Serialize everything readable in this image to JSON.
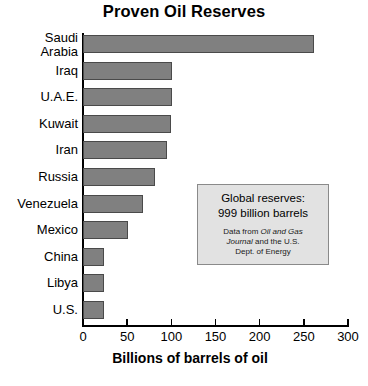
{
  "chart_data": {
    "type": "bar",
    "orientation": "horizontal",
    "title": "Proven Oil Reserves",
    "xlabel": "Billions of barrels of oil",
    "ylabel": "",
    "xlim": [
      0,
      300
    ],
    "xticks": [
      0,
      50,
      100,
      150,
      200,
      250,
      300
    ],
    "grid": false,
    "legend": null,
    "bar_color": "#808080",
    "bar_edge_color": "#4a4a4a",
    "categories": [
      "Saudi Arabia",
      "Iraq",
      "U.A.E.",
      "Kuwait",
      "Iran",
      "Russia",
      "Venezuela",
      "Mexico",
      "China",
      "Libya",
      "U.S."
    ],
    "values": [
      262,
      101,
      101,
      100,
      95,
      82,
      68,
      51,
      24,
      24,
      24
    ],
    "annotations": [
      {
        "line1": "Global reserves:",
        "line2": "999 billion barrels",
        "source_prefix": "Data from ",
        "source_italic_1": "Oil and Gas",
        "source_middle": "Journal",
        "source_suffix": " and the U.S. Dept. of Energy"
      }
    ]
  },
  "chart": {
    "title": "Proven Oil Reserves",
    "x_axis_title": "Billions of barrels of oil",
    "categories": [
      {
        "label_line1": "Saudi",
        "label_line2": "Arabia",
        "value": 262
      },
      {
        "label_line1": "Iraq",
        "label_line2": "",
        "value": 101
      },
      {
        "label_line1": "U.A.E.",
        "label_line2": "",
        "value": 101
      },
      {
        "label_line1": "Kuwait",
        "label_line2": "",
        "value": 100
      },
      {
        "label_line1": "Iran",
        "label_line2": "",
        "value": 95
      },
      {
        "label_line1": "Russia",
        "label_line2": "",
        "value": 82
      },
      {
        "label_line1": "Venezuela",
        "label_line2": "",
        "value": 68
      },
      {
        "label_line1": "Mexico",
        "label_line2": "",
        "value": 51
      },
      {
        "label_line1": "China",
        "label_line2": "",
        "value": 24
      },
      {
        "label_line1": "Libya",
        "label_line2": "",
        "value": 24
      },
      {
        "label_line1": "U.S.",
        "label_line2": "",
        "value": 24
      }
    ],
    "x_ticks": [
      "0",
      "50",
      "100",
      "150",
      "200",
      "250",
      "300"
    ],
    "annotation": {
      "headline_line1": "Global reserves:",
      "headline_line2": "999 billion barrels",
      "source_part1": "Data from ",
      "source_italic1": "Oil and Gas",
      "source_italic2": "Journal",
      "source_part2": " and the U.S.",
      "source_part3": "Dept. of Energy"
    }
  }
}
